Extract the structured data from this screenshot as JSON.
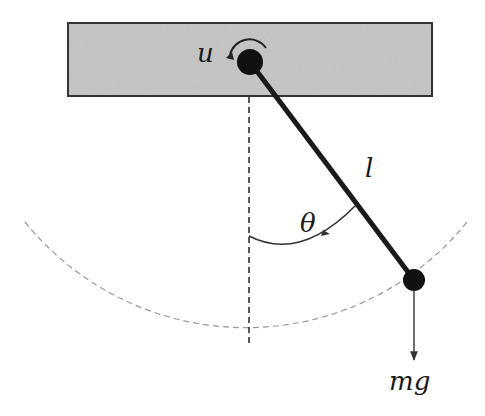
{
  "diagram": {
    "labels": {
      "torque": "u",
      "length": "l",
      "angle": "θ",
      "force": "mg"
    },
    "colors": {
      "ceiling_fill": "#c4c4c4",
      "ceiling_stroke": "#333333",
      "rod": "#1a1a1a",
      "mass": "#111111",
      "dashed": "#888888",
      "text": "#1a1a1a"
    },
    "geometry": {
      "pivot": [
        250,
        62
      ],
      "bob": [
        414,
        280
      ],
      "rod_length_px": 273,
      "swing_radius_px": 284
    }
  }
}
